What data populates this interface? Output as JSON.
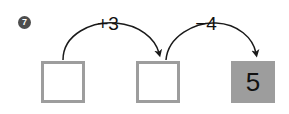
{
  "item": {
    "number": "7"
  },
  "boxes": [
    {
      "name": "box-1",
      "value": "",
      "filled": false
    },
    {
      "name": "box-2",
      "value": "",
      "filled": false
    },
    {
      "name": "box-3",
      "value": "5",
      "filled": true
    }
  ],
  "operations": [
    {
      "name": "op-1",
      "label": "+3"
    },
    {
      "name": "op-2",
      "label": "−4"
    }
  ],
  "colors": {
    "box_border": "#9d9d9d",
    "box_fill": "#9d9d9d",
    "badge": "#4d4d4d",
    "arrow": "#1a1a1a",
    "text": "#111111",
    "background": "#ffffff"
  }
}
